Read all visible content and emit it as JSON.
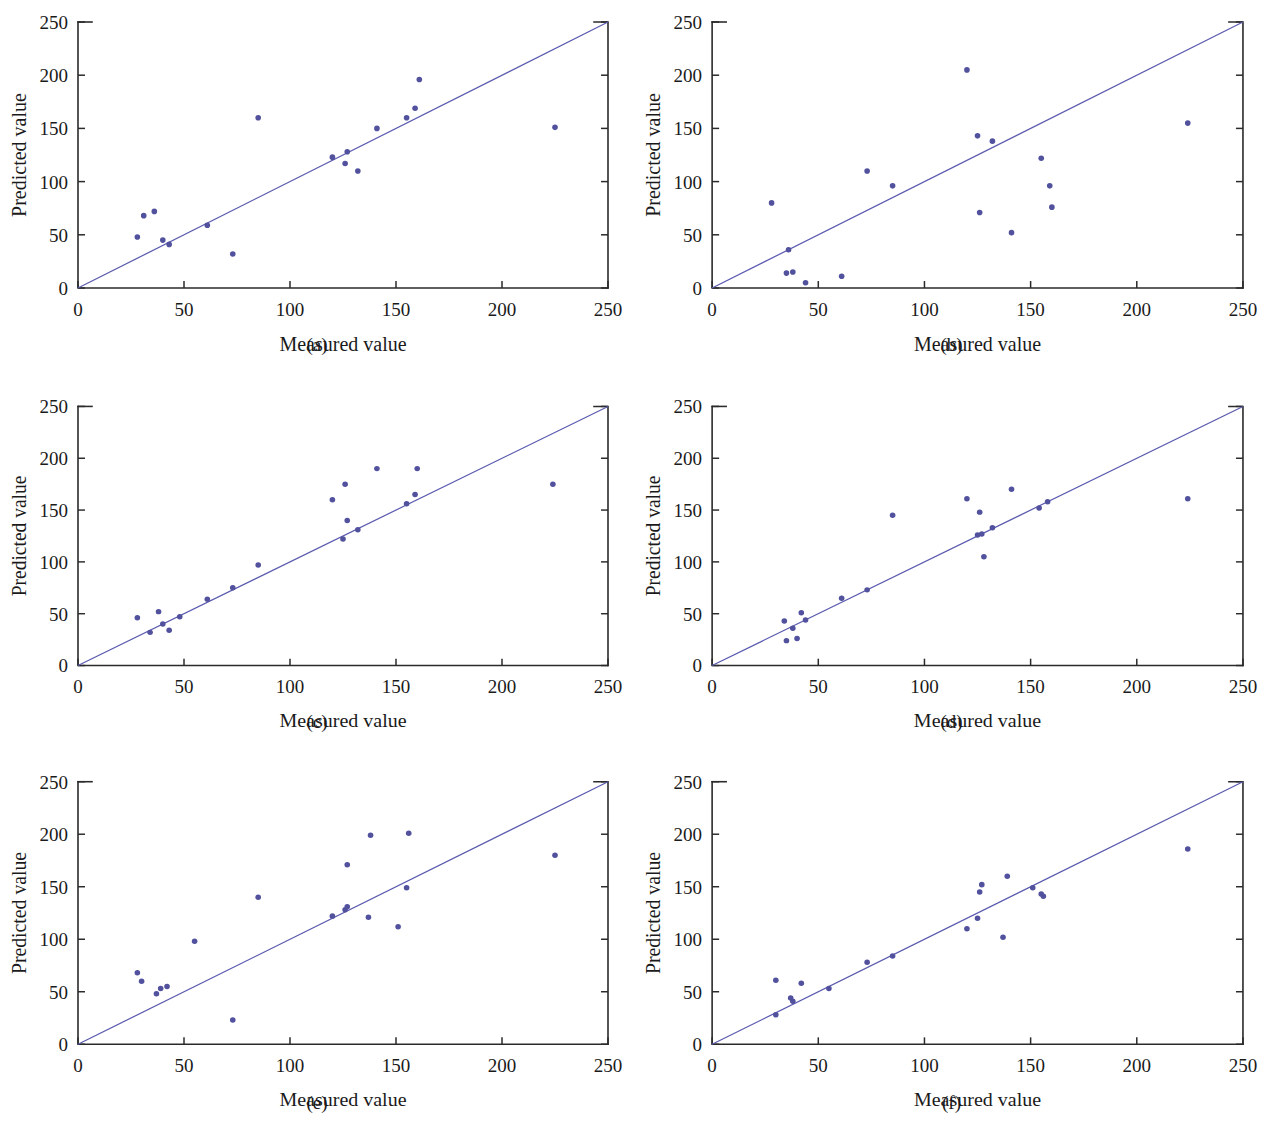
{
  "figure": {
    "panels": [
      {
        "id": "a",
        "caption": "(a)",
        "chart_data": {
          "type": "scatter",
          "title": "",
          "xlabel": "Measured value",
          "ylabel": "Predicted value",
          "xlim": [
            0,
            250
          ],
          "ylim": [
            0,
            250
          ],
          "xticks": [
            0,
            50,
            100,
            150,
            200,
            250
          ],
          "yticks": [
            0,
            50,
            100,
            150,
            200,
            250
          ],
          "xticklabels": [
            "0",
            "50",
            "100",
            "150",
            "200",
            "250"
          ],
          "yticklabels": [
            "0",
            "50",
            "100",
            "150",
            "200",
            "250"
          ],
          "grid": false,
          "legend": null,
          "reference_line": {
            "name": "1:1 identity line",
            "from": [
              0,
              0
            ],
            "to": [
              250,
              250
            ],
            "color": "#5b5bb0"
          },
          "series": [
            {
              "name": "Predicted vs measured",
              "color": "#51519e",
              "points": [
                [
                  28,
                  48
                ],
                [
                  31,
                  68
                ],
                [
                  36,
                  72
                ],
                [
                  40,
                  45
                ],
                [
                  43,
                  41
                ],
                [
                  61,
                  59
                ],
                [
                  73,
                  32
                ],
                [
                  85,
                  160
                ],
                [
                  120,
                  123
                ],
                [
                  126,
                  117
                ],
                [
                  127,
                  128
                ],
                [
                  132,
                  110
                ],
                [
                  141,
                  150
                ],
                [
                  155,
                  160
                ],
                [
                  159,
                  169
                ],
                [
                  161,
                  196
                ],
                [
                  225,
                  151
                ]
              ]
            }
          ]
        }
      },
      {
        "id": "b",
        "caption": "(b)",
        "chart_data": {
          "type": "scatter",
          "title": "",
          "xlabel": "Measured value",
          "ylabel": "Predicted value",
          "xlim": [
            0,
            250
          ],
          "ylim": [
            0,
            250
          ],
          "xticks": [
            0,
            50,
            100,
            150,
            200,
            250
          ],
          "yticks": [
            0,
            50,
            100,
            150,
            200,
            250
          ],
          "xticklabels": [
            "0",
            "50",
            "100",
            "150",
            "200",
            "250"
          ],
          "yticklabels": [
            "0",
            "50",
            "100",
            "150",
            "200",
            "250"
          ],
          "grid": false,
          "legend": null,
          "reference_line": {
            "name": "1:1 identity line",
            "from": [
              0,
              0
            ],
            "to": [
              250,
              250
            ],
            "color": "#5b5bb0"
          },
          "series": [
            {
              "name": "Predicted vs measured",
              "color": "#51519e",
              "points": [
                [
                  28,
                  80
                ],
                [
                  36,
                  36
                ],
                [
                  35,
                  14
                ],
                [
                  38,
                  15
                ],
                [
                  44,
                  5
                ],
                [
                  61,
                  11
                ],
                [
                  73,
                  110
                ],
                [
                  85,
                  96
                ],
                [
                  120,
                  205
                ],
                [
                  125,
                  143
                ],
                [
                  126,
                  71
                ],
                [
                  132,
                  138
                ],
                [
                  141,
                  52
                ],
                [
                  155,
                  122
                ],
                [
                  159,
                  96
                ],
                [
                  160,
                  76
                ],
                [
                  224,
                  155
                ]
              ]
            }
          ]
        }
      },
      {
        "id": "c",
        "caption": "(c)",
        "chart_data": {
          "type": "scatter",
          "title": "",
          "xlabel": "Measured value",
          "ylabel": "Predicted value",
          "xlim": [
            0,
            250
          ],
          "ylim": [
            0,
            250
          ],
          "xticks": [
            0,
            50,
            100,
            150,
            200,
            250
          ],
          "yticks": [
            0,
            50,
            100,
            150,
            200,
            250
          ],
          "xticklabels": [
            "0",
            "50",
            "100",
            "150",
            "200",
            "250"
          ],
          "yticklabels": [
            "0",
            "50",
            "100",
            "150",
            "200",
            "250"
          ],
          "grid": false,
          "legend": null,
          "reference_line": {
            "name": "1:1 identity line",
            "from": [
              0,
              0
            ],
            "to": [
              250,
              250
            ],
            "color": "#5b5bb0"
          },
          "series": [
            {
              "name": "Predicted vs measured",
              "color": "#51519e",
              "points": [
                [
                  28,
                  46
                ],
                [
                  34,
                  32
                ],
                [
                  38,
                  52
                ],
                [
                  40,
                  40
                ],
                [
                  43,
                  34
                ],
                [
                  48,
                  47
                ],
                [
                  61,
                  64
                ],
                [
                  73,
                  75
                ],
                [
                  85,
                  97
                ],
                [
                  120,
                  160
                ],
                [
                  125,
                  122
                ],
                [
                  126,
                  175
                ],
                [
                  127,
                  140
                ],
                [
                  132,
                  131
                ],
                [
                  141,
                  190
                ],
                [
                  155,
                  156
                ],
                [
                  159,
                  165
                ],
                [
                  160,
                  190
                ],
                [
                  224,
                  175
                ]
              ]
            }
          ]
        }
      },
      {
        "id": "d",
        "caption": "(d)",
        "chart_data": {
          "type": "scatter",
          "title": "",
          "xlabel": "Measured value",
          "ylabel": "Predicted value",
          "xlim": [
            0,
            250
          ],
          "ylim": [
            0,
            250
          ],
          "xticks": [
            0,
            50,
            100,
            150,
            200,
            250
          ],
          "yticks": [
            0,
            50,
            100,
            150,
            200,
            250
          ],
          "xticklabels": [
            "0",
            "50",
            "100",
            "150",
            "200",
            "250"
          ],
          "yticklabels": [
            "0",
            "50",
            "100",
            "150",
            "200",
            "250"
          ],
          "grid": false,
          "legend": null,
          "reference_line": {
            "name": "1:1 identity line",
            "from": [
              0,
              0
            ],
            "to": [
              250,
              250
            ],
            "color": "#5b5bb0"
          },
          "series": [
            {
              "name": "Predicted vs measured",
              "color": "#51519e",
              "points": [
                [
                  34,
                  43
                ],
                [
                  35,
                  24
                ],
                [
                  38,
                  36
                ],
                [
                  40,
                  26
                ],
                [
                  42,
                  51
                ],
                [
                  44,
                  44
                ],
                [
                  61,
                  65
                ],
                [
                  73,
                  73
                ],
                [
                  85,
                  145
                ],
                [
                  120,
                  161
                ],
                [
                  125,
                  126
                ],
                [
                  126,
                  148
                ],
                [
                  127,
                  127
                ],
                [
                  128,
                  105
                ],
                [
                  132,
                  133
                ],
                [
                  141,
                  170
                ],
                [
                  154,
                  152
                ],
                [
                  158,
                  158
                ],
                [
                  224,
                  161
                ]
              ]
            }
          ]
        }
      },
      {
        "id": "e",
        "caption": "(e)",
        "chart_data": {
          "type": "scatter",
          "title": "",
          "xlabel": "Measured value",
          "ylabel": "Predicted value",
          "xlim": [
            0,
            250
          ],
          "ylim": [
            0,
            250
          ],
          "xticks": [
            0,
            50,
            100,
            150,
            200,
            250
          ],
          "yticks": [
            0,
            50,
            100,
            150,
            200,
            250
          ],
          "xticklabels": [
            "0",
            "50",
            "100",
            "150",
            "200",
            "250"
          ],
          "yticklabels": [
            "0",
            "50",
            "100",
            "150",
            "200",
            "250"
          ],
          "grid": false,
          "legend": null,
          "reference_line": {
            "name": "1:1 identity line",
            "from": [
              0,
              0
            ],
            "to": [
              250,
              250
            ],
            "color": "#5b5bb0"
          },
          "series": [
            {
              "name": "Predicted vs measured",
              "color": "#51519e",
              "points": [
                [
                  28,
                  68
                ],
                [
                  30,
                  60
                ],
                [
                  37,
                  48
                ],
                [
                  39,
                  53
                ],
                [
                  42,
                  55
                ],
                [
                  55,
                  98
                ],
                [
                  73,
                  23
                ],
                [
                  85,
                  140
                ],
                [
                  120,
                  122
                ],
                [
                  126,
                  128
                ],
                [
                  127,
                  131
                ],
                [
                  127,
                  171
                ],
                [
                  137,
                  121
                ],
                [
                  138,
                  199
                ],
                [
                  151,
                  112
                ],
                [
                  155,
                  149
                ],
                [
                  156,
                  201
                ],
                [
                  225,
                  180
                ]
              ]
            }
          ]
        }
      },
      {
        "id": "f",
        "caption": "(f)",
        "chart_data": {
          "type": "scatter",
          "title": "",
          "xlabel": "Measured value",
          "ylabel": "Predicted value",
          "xlim": [
            0,
            250
          ],
          "ylim": [
            0,
            250
          ],
          "xticks": [
            0,
            50,
            100,
            150,
            200,
            250
          ],
          "yticks": [
            0,
            50,
            100,
            150,
            200,
            250
          ],
          "xticklabels": [
            "0",
            "50",
            "100",
            "150",
            "200",
            "250"
          ],
          "yticklabels": [
            "0",
            "50",
            "100",
            "150",
            "200",
            "250"
          ],
          "grid": false,
          "legend": null,
          "reference_line": {
            "name": "1:1 identity line",
            "from": [
              0,
              0
            ],
            "to": [
              250,
              250
            ],
            "color": "#5b5bb0"
          },
          "series": [
            {
              "name": "Predicted vs measured",
              "color": "#51519e",
              "points": [
                [
                  30,
                  28
                ],
                [
                  30,
                  61
                ],
                [
                  37,
                  44
                ],
                [
                  38,
                  41
                ],
                [
                  42,
                  58
                ],
                [
                  55,
                  53
                ],
                [
                  73,
                  78
                ],
                [
                  85,
                  84
                ],
                [
                  120,
                  110
                ],
                [
                  125,
                  120
                ],
                [
                  126,
                  145
                ],
                [
                  127,
                  152
                ],
                [
                  137,
                  102
                ],
                [
                  139,
                  160
                ],
                [
                  151,
                  149
                ],
                [
                  155,
                  143
                ],
                [
                  156,
                  141
                ],
                [
                  224,
                  186
                ]
              ]
            }
          ]
        }
      }
    ]
  }
}
